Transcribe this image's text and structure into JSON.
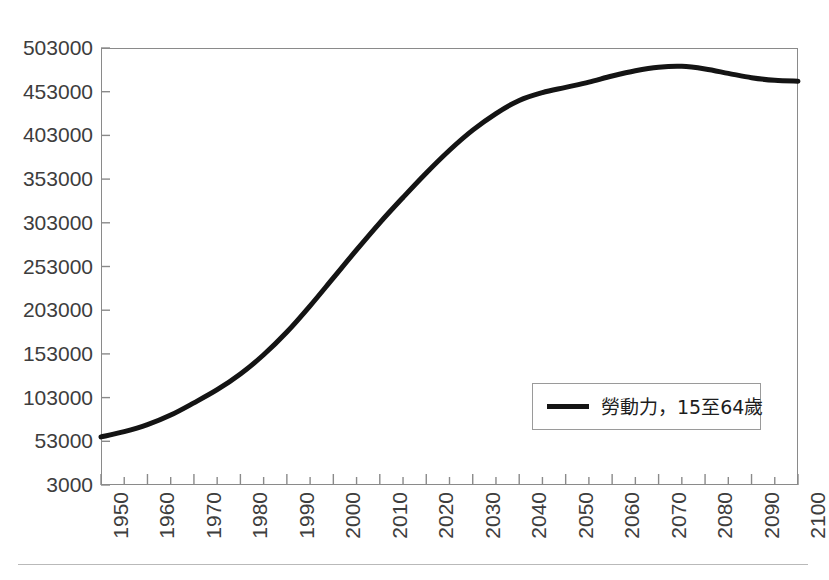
{
  "chart_data": {
    "type": "line",
    "title": "",
    "subtitle": "",
    "xlabel": "",
    "ylabel": "",
    "xlim": [
      1950,
      2100
    ],
    "ylim": [
      3000,
      503000
    ],
    "grid": false,
    "legend_position": "inside-bottom-right",
    "y_ticks": [
      3000,
      53000,
      103000,
      153000,
      203000,
      253000,
      303000,
      353000,
      403000,
      453000,
      503000
    ],
    "y_tick_labels": [
      "3000",
      "53000",
      "103000",
      "153000",
      "203000",
      "253000",
      "303000",
      "353000",
      "403000",
      "453000",
      "503000"
    ],
    "x_ticks": [
      1950,
      1960,
      1970,
      1980,
      1990,
      2000,
      2010,
      2020,
      2030,
      2040,
      2050,
      2060,
      2070,
      2080,
      2090,
      2100
    ],
    "x_tick_labels": [
      "1950",
      "1960",
      "1970",
      "1980",
      "1990",
      "2000",
      "2010",
      "2020",
      "2030",
      "2040",
      "2050",
      "2060",
      "2070",
      "2080",
      "2090",
      "2100"
    ],
    "x_minor_tick_step": 5,
    "series": [
      {
        "name": "勞動力，15至64歲",
        "color": "#141414",
        "line_width": 5,
        "x": [
          1950,
          1955,
          1960,
          1965,
          1970,
          1975,
          1980,
          1985,
          1990,
          1995,
          2000,
          2005,
          2010,
          2015,
          2020,
          2025,
          2030,
          2035,
          2040,
          2045,
          2050,
          2055,
          2060,
          2065,
          2070,
          2075,
          2080,
          2085,
          2090,
          2095,
          2100
        ],
        "values": [
          58000,
          64000,
          72000,
          83000,
          97000,
          112000,
          130000,
          152000,
          178000,
          208000,
          240000,
          272000,
          303000,
          332000,
          360000,
          386000,
          409000,
          428000,
          443000,
          452000,
          458000,
          464000,
          471000,
          477000,
          481000,
          482000,
          479000,
          474000,
          469000,
          466000,
          465000
        ]
      }
    ],
    "legend": [
      {
        "label": "勞動力，15至64歲",
        "color": "#141414"
      }
    ]
  },
  "legend": {
    "entry_label": "勞動力，15至64歲"
  },
  "axes": {
    "frame_color": "#8a8a8a",
    "tick_color": "#8a8a8a",
    "label_color": "#3d3d3d"
  }
}
